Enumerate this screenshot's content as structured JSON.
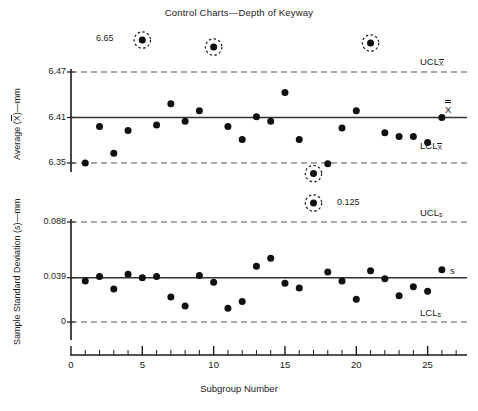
{
  "title": "Control Charts—Depth of Keyway",
  "xaxis": {
    "label": "Subgroup Number",
    "ticks": [
      0,
      5,
      10,
      15,
      20,
      25
    ],
    "tick_labels": [
      "0",
      "5",
      "10",
      "15",
      "20",
      "25"
    ],
    "min": 0,
    "max": 27.2,
    "minor_tick_interval": 1
  },
  "xbar_chart": {
    "ylabel_prefix": "Average (",
    "ylabel_symbol": "X",
    "ylabel_suffix": ")—mm",
    "ylabel_full": "Average (X̅)—mm",
    "tick_labels": [
      "6.47",
      "6.41",
      "6.35"
    ],
    "ucl_label": "UCL",
    "ucl_sub": "X̅",
    "center_label": "X̅̅",
    "lcl_label": "LCL",
    "lcl_sub": "X̅",
    "annotation": "6.65"
  },
  "s_chart": {
    "ylabel_full": "Sample Standard Deviation (s)—mm",
    "tick_labels": [
      "0.088",
      "0.039",
      "0"
    ],
    "ucl_label": "UCL",
    "ucl_sub": "s",
    "center_label": "s",
    "lcl_label": "LCL",
    "lcl_sub": "s",
    "annotation": "0.125"
  },
  "colors": {
    "ink": "#1a1a1a",
    "marker": "#101010",
    "limit_line": "#555555",
    "center_line": "#333333",
    "background": "#ffffff"
  },
  "chart_data": [
    {
      "type": "scatter",
      "name": "xbar-chart",
      "title": "Control Charts—Depth of Keyway",
      "xlabel": "Subgroup Number",
      "ylabel": "Average (X̅)—mm",
      "xlim": [
        0,
        27.2
      ],
      "ylim": [
        6.32,
        6.68
      ],
      "grid": false,
      "yticks": [
        6.35,
        6.41,
        6.47
      ],
      "ytick_labels": [
        "6.35",
        "6.41",
        "6.47"
      ],
      "center_line": {
        "value": 6.41,
        "label": "X̅̅",
        "style": "solid"
      },
      "control_limits": [
        {
          "value": 6.47,
          "label": "UCL",
          "sublabel": "X̅",
          "style": "dashed"
        },
        {
          "value": 6.35,
          "label": "LCL",
          "sublabel": "X̅",
          "style": "dashed"
        }
      ],
      "x": [
        1,
        2,
        3,
        4,
        5,
        6,
        7,
        8,
        9,
        10,
        11,
        12,
        13,
        14,
        15,
        16,
        17,
        18,
        19,
        20,
        21,
        22,
        23,
        24,
        25,
        26
      ],
      "y": [
        6.35,
        6.398,
        6.363,
        6.393,
        6.65,
        6.4,
        6.428,
        6.405,
        6.419,
        6.65,
        6.398,
        6.381,
        6.411,
        6.405,
        6.443,
        6.381,
        6.336,
        6.349,
        6.396,
        6.419,
        6.65,
        6.39,
        6.385,
        6.385,
        6.377,
        6.41
      ],
      "out_of_control": [
        {
          "x": 5,
          "y": 6.65,
          "label": "6.65",
          "marker": "circled"
        },
        {
          "x": 10,
          "y": 6.65,
          "label": "",
          "marker": "circled"
        },
        {
          "x": 21,
          "y": 6.65,
          "label": "",
          "marker": "circled"
        },
        {
          "x": 17,
          "y": 6.336,
          "label": "",
          "marker": "circled"
        }
      ],
      "annotations": [
        {
          "text": "6.65",
          "x": 5,
          "y": 6.65,
          "position": "left"
        }
      ]
    },
    {
      "type": "scatter",
      "name": "s-chart",
      "xlabel": "Subgroup Number",
      "ylabel": "Sample Standard Deviation (s)—mm",
      "xlim": [
        0,
        27.2
      ],
      "ylim": [
        -0.012,
        0.135
      ],
      "grid": false,
      "yticks": [
        0,
        0.039,
        0.088
      ],
      "ytick_labels": [
        "0",
        "0.039",
        "0.088"
      ],
      "center_line": {
        "value": 0.039,
        "label": "s",
        "style": "solid"
      },
      "control_limits": [
        {
          "value": 0.088,
          "label": "UCL",
          "sublabel": "s",
          "style": "dashed"
        },
        {
          "value": 0.0,
          "label": "LCL",
          "sublabel": "s",
          "style": "dashed"
        }
      ],
      "x": [
        1,
        2,
        3,
        4,
        5,
        6,
        7,
        8,
        9,
        10,
        11,
        12,
        13,
        14,
        15,
        16,
        17,
        18,
        19,
        20,
        21,
        22,
        23,
        24,
        25,
        26
      ],
      "y": [
        0.036,
        0.04,
        0.029,
        0.042,
        0.039,
        0.04,
        0.022,
        0.014,
        0.041,
        0.035,
        0.012,
        0.018,
        0.049,
        0.056,
        0.034,
        0.03,
        0.125,
        0.044,
        0.036,
        0.02,
        0.045,
        0.038,
        0.023,
        0.031,
        0.027,
        0.046
      ],
      "out_of_control": [
        {
          "x": 17,
          "y": 0.125,
          "label": "0.125",
          "marker": "circled"
        }
      ],
      "annotations": [
        {
          "text": "0.125",
          "x": 17,
          "y": 0.125,
          "position": "right"
        }
      ]
    }
  ]
}
